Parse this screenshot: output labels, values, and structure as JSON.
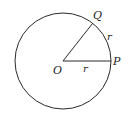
{
  "diagram": {
    "type": "circle-radian",
    "colors": {
      "stroke": "#2a2a2a",
      "background": "#ffffff",
      "text": "#222222"
    },
    "circle": {
      "cx": 63,
      "cy": 61,
      "r": 48
    },
    "points": {
      "O": {
        "label": "O",
        "x": 63,
        "y": 61
      },
      "P": {
        "label": "P",
        "x": 111,
        "y": 61
      },
      "Q": {
        "label": "Q",
        "x": 92.5,
        "y": 24
      }
    },
    "labels": {
      "radius_label": "r",
      "arc_label": "r",
      "center": "O",
      "p": "P",
      "q": "Q"
    }
  }
}
